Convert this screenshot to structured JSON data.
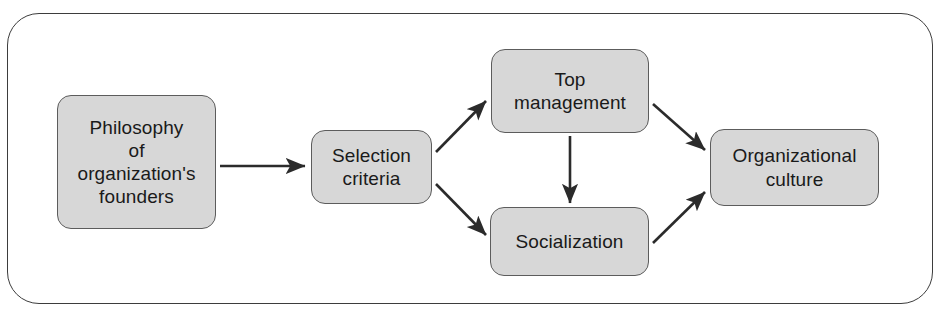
{
  "figure": {
    "frame": {
      "shape": "rounded-rectangle",
      "border_color": "#3d3d3d"
    },
    "style": {
      "node_fill": "#d7d7d7",
      "node_border": "#5c5c5c",
      "arrow_color": "#2b2b2b",
      "text_color": "#1a1a1a"
    },
    "nodes": [
      {
        "id": "philosophy",
        "label": "Philosophy\nof\norganization's\nfounders"
      },
      {
        "id": "selection",
        "label": "Selection\ncriteria"
      },
      {
        "id": "top",
        "label": "Top\nmanagement"
      },
      {
        "id": "social",
        "label": "Socialization"
      },
      {
        "id": "culture",
        "label": "Organizational\nculture"
      }
    ],
    "edges": [
      {
        "id": "philosophy-to-selection",
        "from": "philosophy",
        "to": "selection",
        "direction": "right"
      },
      {
        "id": "selection-to-top",
        "from": "selection",
        "to": "top",
        "direction": "up-right"
      },
      {
        "id": "selection-to-social",
        "from": "selection",
        "to": "social",
        "direction": "down-right"
      },
      {
        "id": "top-to-social",
        "from": "top",
        "to": "social",
        "direction": "down"
      },
      {
        "id": "top-to-culture",
        "from": "top",
        "to": "culture",
        "direction": "down-right"
      },
      {
        "id": "social-to-culture",
        "from": "social",
        "to": "culture",
        "direction": "up-right"
      }
    ]
  }
}
